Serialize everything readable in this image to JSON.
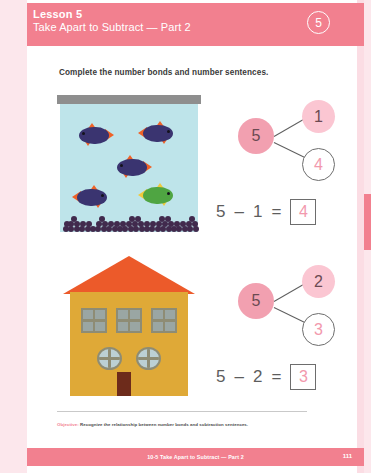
{
  "header": {
    "lesson_label": "Lesson 5",
    "lesson_title": "Take Apart to Subtract — Part 2",
    "badge": "5",
    "bar_color": "#f2808f"
  },
  "instruction": "Complete the number bonds and number sentences.",
  "problems": [
    {
      "illustration": "aquarium-with-fish",
      "bond": {
        "total": "5",
        "part_known": "1",
        "part_answer": "4"
      },
      "equation": {
        "minuend": "5",
        "operator": "–",
        "subtrahend": "1",
        "equals": "=",
        "answer": "4"
      }
    },
    {
      "illustration": "house-with-windows",
      "bond": {
        "total": "5",
        "part_known": "2",
        "part_answer": "3"
      },
      "equation": {
        "minuend": "5",
        "operator": "–",
        "subtrahend": "2",
        "equals": "=",
        "answer": "3"
      }
    }
  ],
  "aquarium": {
    "lid_color": "#8e8e8e",
    "water_color": "#bee4ea",
    "gravel_color": "#412a4d",
    "fish": [
      {
        "color": "#3a3470",
        "fin_color": "#ef6227",
        "x": 12,
        "y": 22,
        "flip": false
      },
      {
        "color": "#3a3470",
        "fin_color": "#ef6227",
        "x": 78,
        "y": 20,
        "flip": true
      },
      {
        "color": "#3a3470",
        "fin_color": "#ef6227",
        "x": 50,
        "y": 54,
        "flip": false
      },
      {
        "color": "#3a3470",
        "fin_color": "#ef6227",
        "x": 12,
        "y": 84,
        "flip": true
      },
      {
        "color": "#4fa542",
        "fin_color": "#f0c93c",
        "x": 78,
        "y": 82,
        "flip": true
      }
    ]
  },
  "house": {
    "roof_color": "#ec5a2a",
    "body_color": "#dfa937",
    "door_color": "#6d2b1b",
    "window_glass": "#bcd0d4",
    "window_frame": "#8e8c74",
    "square_windows": 3,
    "round_windows": 2
  },
  "footer": {
    "objective_key": "Objective:",
    "objective_text": " Recognize the relationship between number bonds and subtraction sentences.",
    "bar_title": "10-5  Take Apart to Subtract — Part 2",
    "page_number": "111"
  }
}
